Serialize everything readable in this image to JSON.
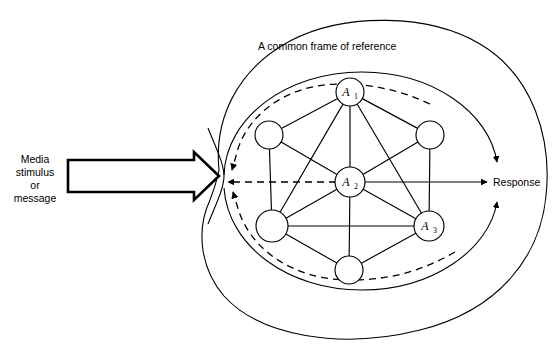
{
  "diagram": {
    "title": "A common frame of reference",
    "input_label_lines": [
      "Media",
      "stimulus",
      "or",
      "message"
    ],
    "output_label": "Response",
    "background_color": "#ffffff",
    "line_color": "#000000",
    "nodes": [
      {
        "id": "n_top",
        "label": "A",
        "sub": "1",
        "cx": 350,
        "cy": 92,
        "r": 14
      },
      {
        "id": "n_ul",
        "label": "",
        "sub": "",
        "cx": 269,
        "cy": 135,
        "r": 14
      },
      {
        "id": "n_ur",
        "label": "",
        "sub": "",
        "cx": 430,
        "cy": 135,
        "r": 14
      },
      {
        "id": "n_mid",
        "label": "A",
        "sub": "2",
        "cx": 350,
        "cy": 182,
        "r": 15
      },
      {
        "id": "n_ll",
        "label": "",
        "sub": "",
        "cx": 272,
        "cy": 226,
        "r": 16
      },
      {
        "id": "n_lr",
        "label": "A",
        "sub": "3",
        "cx": 429,
        "cy": 226,
        "r": 15
      },
      {
        "id": "n_bot",
        "label": "",
        "sub": "",
        "cx": 349,
        "cy": 270,
        "r": 14
      }
    ],
    "edges": [
      [
        "n_top",
        "n_ul"
      ],
      [
        "n_top",
        "n_ur"
      ],
      [
        "n_top",
        "n_mid"
      ],
      [
        "n_top",
        "n_ll"
      ],
      [
        "n_top",
        "n_lr"
      ],
      [
        "n_ul",
        "n_mid"
      ],
      [
        "n_ul",
        "n_ll"
      ],
      [
        "n_ur",
        "n_mid"
      ],
      [
        "n_ur",
        "n_lr"
      ],
      [
        "n_mid",
        "n_ll"
      ],
      [
        "n_mid",
        "n_lr"
      ],
      [
        "n_mid",
        "n_bot"
      ],
      [
        "n_ll",
        "n_lr"
      ],
      [
        "n_ll",
        "n_bot"
      ],
      [
        "n_lr",
        "n_bot"
      ]
    ],
    "shapes": {
      "outer_blob_name": "outer-frame-boundary",
      "inner_ellipse_name": "inner-solid-ellipse",
      "dashed_ellipse_name": "feedback-dashed-ellipse"
    },
    "colors": {
      "stroke": "#000000",
      "fill": "#ffffff"
    }
  }
}
